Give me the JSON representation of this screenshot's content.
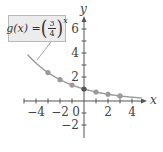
{
  "chart_data": {
    "type": "line",
    "title": "",
    "function_label": {
      "lhs": "g(x) =",
      "base_numerator": "3",
      "base_denominator": "4",
      "exponent": "x"
    },
    "xlabel": "x",
    "ylabel": "y",
    "x_ticks": [
      -4,
      -2,
      0,
      2,
      4
    ],
    "x_tick_labels": [
      "−4",
      "−2",
      "0",
      "2",
      "4"
    ],
    "y_ticks": [
      -2,
      2,
      4,
      6
    ],
    "y_tick_labels": [
      "−2",
      "2",
      "4",
      "6"
    ],
    "xlim": [
      -5,
      5
    ],
    "ylim": [
      -3,
      7
    ],
    "grid": false,
    "points": [
      {
        "x": -3,
        "y": 2.37
      },
      {
        "x": -2,
        "y": 1.78
      },
      {
        "x": -1,
        "y": 1.33
      },
      {
        "x": 0,
        "y": 1
      },
      {
        "x": 1,
        "y": 0.75
      },
      {
        "x": 2,
        "y": 0.56
      },
      {
        "x": 3,
        "y": 0.42
      }
    ],
    "curve": "g(x) = (3/4)^x",
    "colors": {
      "axis": "#555555",
      "curve": "#9a9a9a",
      "points": "#9a9a9a",
      "intercept_point": "#555555",
      "callout_fill": "#ececec",
      "callout_border": "#b9b9b9"
    }
  }
}
